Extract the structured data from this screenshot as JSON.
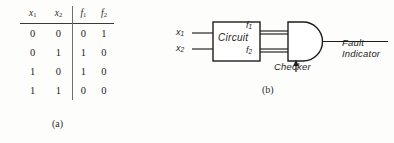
{
  "figure": {
    "kind": "textbook-figure",
    "background_color": "#fdfdfc",
    "ink_color": "#1a1a1a"
  },
  "panel_a": {
    "caption": "(a)",
    "table": {
      "headers": [
        {
          "base": "x",
          "sub": "1"
        },
        {
          "base": "x",
          "sub": "2"
        },
        {
          "base": "f",
          "sub": "1"
        },
        {
          "base": "f",
          "sub": "2"
        }
      ],
      "header_labels": [
        "x1",
        "x2",
        "f1",
        "f2"
      ],
      "rows": [
        [
          "0",
          "0",
          "0",
          "1"
        ],
        [
          "0",
          "1",
          "1",
          "0"
        ],
        [
          "1",
          "0",
          "1",
          "0"
        ],
        [
          "1",
          "1",
          "0",
          "0"
        ]
      ],
      "divider_after_column": 2
    }
  },
  "panel_b": {
    "caption": "(b)",
    "input_1": {
      "base": "x",
      "sub": "1"
    },
    "input_2": {
      "base": "x",
      "sub": "2"
    },
    "block_label": "Circuit",
    "output_1": {
      "base": "f",
      "sub": "1"
    },
    "output_2": {
      "base": "f",
      "sub": "2"
    },
    "gate_type": "AND",
    "gate_annotation": "Checker",
    "final_output_line_1": "Fault",
    "final_output_line_2": "Indicator"
  }
}
